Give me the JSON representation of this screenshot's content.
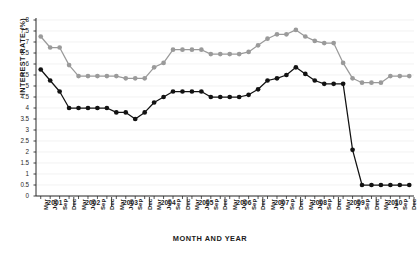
{
  "chart_data": {
    "type": "line",
    "title": "",
    "xlabel": "MONTH AND YEAR",
    "ylabel": "INTEREST RATE (%)",
    "ylim": [
      0,
      8
    ],
    "ytick_step": 0.5,
    "yticks": [
      "0",
      "0.5",
      "1",
      "1.5",
      "2",
      "2.5",
      "3",
      "3.5",
      "4",
      "4.5",
      "5",
      "5.5",
      "6",
      "6.5",
      "7",
      "7.5",
      "8"
    ],
    "grid": true,
    "legend": "none",
    "years": [
      "2001",
      "2002",
      "2003",
      "2004",
      "2005",
      "2006",
      "2007",
      "2008",
      "2009",
      "2010"
    ],
    "months": [
      "Mar",
      "Jun",
      "Sep",
      "Dec"
    ],
    "x": [
      "Mar 2001",
      "Jun 2001",
      "Sep 2001",
      "Dec 2001",
      "Mar 2002",
      "Jun 2002",
      "Sep 2002",
      "Dec 2002",
      "Mar 2003",
      "Jun 2003",
      "Sep 2003",
      "Dec 2003",
      "Mar 2004",
      "Jun 2004",
      "Sep 2004",
      "Dec 2004",
      "Mar 2005",
      "Jun 2005",
      "Sep 2005",
      "Dec 2005",
      "Mar 2006",
      "Jun 2006",
      "Sep 2006",
      "Dec 2006",
      "Mar 2007",
      "Jun 2007",
      "Sep 2007",
      "Dec 2007",
      "Mar 2008",
      "Jun 2008",
      "Sep 2008",
      "Dec 2008",
      "Mar 2009",
      "Jun 2009",
      "Sep 2009",
      "Dec 2009",
      "Mar 2010",
      "Jun 2010",
      "Sep 2010",
      "Dec 2010"
    ],
    "series": [
      {
        "name": "upper-series",
        "color": "#9a9a9a",
        "values": [
          7.25,
          6.75,
          6.75,
          5.95,
          5.45,
          5.45,
          5.45,
          5.45,
          5.45,
          5.35,
          5.35,
          5.35,
          5.85,
          6.05,
          6.65,
          6.65,
          6.65,
          6.65,
          6.45,
          6.45,
          6.45,
          6.45,
          6.55,
          6.85,
          7.15,
          7.35,
          7.35,
          7.55,
          7.25,
          7.05,
          6.95,
          6.95,
          6.05,
          5.35,
          5.15,
          5.15,
          5.15,
          5.45,
          5.45,
          5.45
        ]
      },
      {
        "name": "lower-series",
        "color": "#121212",
        "values": [
          5.75,
          5.25,
          4.75,
          4.0,
          4.0,
          4.0,
          4.0,
          4.0,
          3.8,
          3.8,
          3.5,
          3.8,
          4.25,
          4.5,
          4.75,
          4.75,
          4.75,
          4.75,
          4.5,
          4.5,
          4.5,
          4.5,
          4.6,
          4.85,
          5.25,
          5.35,
          5.5,
          5.85,
          5.55,
          5.25,
          5.1,
          5.1,
          5.1,
          2.1,
          0.5,
          0.5,
          0.5,
          0.5,
          0.5,
          0.5
        ]
      }
    ]
  }
}
